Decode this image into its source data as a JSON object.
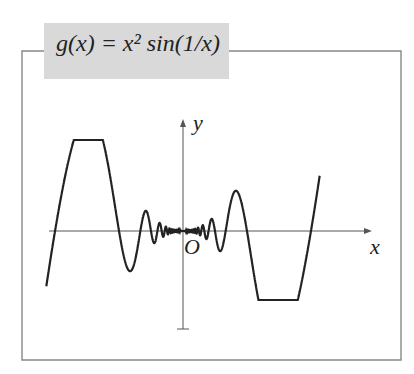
{
  "title": "g(x) = x² sin(1/x)",
  "chart_data": {
    "type": "line",
    "function": "x^2*sin(1/x)",
    "xlabel": "x",
    "ylabel": "y",
    "origin_label": "O",
    "x_range": [
      -0.34,
      0.34
    ],
    "grid": false,
    "legend": null,
    "series": [
      {
        "name": "g(x)",
        "color": "#222222"
      }
    ]
  },
  "axes": {
    "x_label": "x",
    "y_label": "y",
    "origin_label": "O"
  },
  "colors": {
    "curve": "#222222",
    "frame": "#888888",
    "title_bg": "#d9d9d9"
  }
}
